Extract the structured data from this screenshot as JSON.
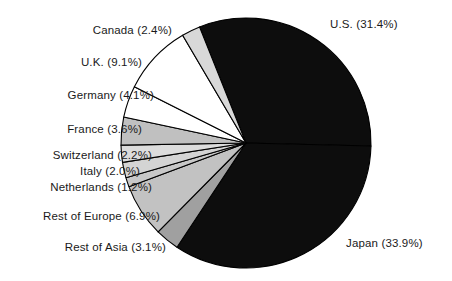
{
  "chart_data": {
    "type": "pie",
    "title": "",
    "subtitle": "",
    "xlabel": "",
    "ylabel": "",
    "legend_position": "none",
    "grid": false,
    "labels_show_percent": true,
    "total_percent": 99.9,
    "categories": [
      "U.S.",
      "Japan",
      "Rest of Asia",
      "Rest of Europe",
      "Netherlands",
      "Italy",
      "Switzerland",
      "France",
      "Germany",
      "U.K.",
      "Canada"
    ],
    "values": [
      31.4,
      33.9,
      3.1,
      6.9,
      1.2,
      2.0,
      2.2,
      3.6,
      4.1,
      9.1,
      2.4
    ],
    "slices": [
      {
        "name": "U.S.",
        "value": 31.4,
        "label": "U.S. (31.4%)",
        "percent_text": "31.4%",
        "fill": "#0d0d0d",
        "label_side": "right"
      },
      {
        "name": "Japan",
        "value": 33.9,
        "label": "Japan (33.9%)",
        "percent_text": "33.9%",
        "fill": "#0d0d0d",
        "label_side": "right"
      },
      {
        "name": "Rest of Asia",
        "value": 3.1,
        "label": "Rest of Asia (3.1%)",
        "percent_text": "3.1%",
        "fill": "#a0a0a0",
        "label_side": "left"
      },
      {
        "name": "Rest of Europe",
        "value": 6.9,
        "label": "Rest of Europe (6.9%)",
        "percent_text": "6.9%",
        "fill": "#c2c2c2",
        "label_side": "left"
      },
      {
        "name": "Netherlands",
        "value": 1.2,
        "label": "Netherlands (1.2%)",
        "percent_text": "1.2%",
        "fill": "#c8c8c8",
        "label_side": "left"
      },
      {
        "name": "Italy",
        "value": 2.0,
        "label": "Italy (2.0%)",
        "percent_text": "2.0%",
        "fill": "#d4d4d4",
        "label_side": "left"
      },
      {
        "name": "Switzerland",
        "value": 2.2,
        "label": "Switzerland (2.2%)",
        "percent_text": "2.2%",
        "fill": "#dcdcdc",
        "label_side": "left"
      },
      {
        "name": "France",
        "value": 3.6,
        "label": "France (3.6%)",
        "percent_text": "3.6%",
        "fill": "#c0c0c0",
        "label_side": "left"
      },
      {
        "name": "Germany",
        "value": 4.1,
        "label": "Germany (4.1%)",
        "percent_text": "4.1%",
        "fill": "#ffffff",
        "label_side": "left"
      },
      {
        "name": "U.K.",
        "value": 9.1,
        "label": "U.K. (9.1%)",
        "percent_text": "9.1%",
        "fill": "#ffffff",
        "label_side": "left"
      },
      {
        "name": "Canada",
        "value": 2.4,
        "label": "Canada (2.4%)",
        "percent_text": "2.4%",
        "fill": "#d8d8d8",
        "label_side": "left"
      }
    ],
    "geometry": {
      "center_x": 246,
      "center_y": 143,
      "radius": 125,
      "start_angle_deg": -111.8,
      "direction": "clockwise",
      "stroke_color": "#000000",
      "stroke_width": 1.1
    },
    "label_positions": [
      {
        "name": "U.S.",
        "x": 330,
        "y": 18,
        "side": "right"
      },
      {
        "name": "Canada",
        "x": 172,
        "y": 24,
        "side": "left"
      },
      {
        "name": "U.K.",
        "x": 142,
        "y": 56,
        "side": "left"
      },
      {
        "name": "Germany",
        "x": 154,
        "y": 89,
        "side": "left"
      },
      {
        "name": "France",
        "x": 142,
        "y": 123,
        "side": "left"
      },
      {
        "name": "Switzerland",
        "x": 152,
        "y": 149,
        "side": "left"
      },
      {
        "name": "Italy",
        "x": 140,
        "y": 165,
        "side": "left"
      },
      {
        "name": "Netherlands",
        "x": 152,
        "y": 181,
        "side": "left"
      },
      {
        "name": "Rest of Europe",
        "x": 160,
        "y": 210,
        "side": "left"
      },
      {
        "name": "Rest of Asia",
        "x": 166,
        "y": 241,
        "side": "left"
      },
      {
        "name": "Japan",
        "x": 346,
        "y": 237,
        "side": "right"
      }
    ]
  },
  "figure": {
    "background": "#ffffff",
    "text_color": "#1a1a1a"
  }
}
